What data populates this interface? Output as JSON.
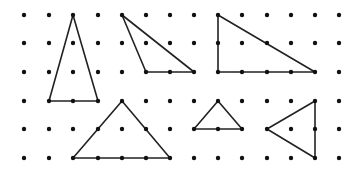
{
  "diagram": {
    "grid": {
      "columns_x": [
        24,
        49,
        73,
        98,
        122,
        146,
        170,
        194,
        218,
        242,
        267,
        291,
        315,
        339
      ],
      "rows_y": [
        15,
        43,
        72,
        101,
        129,
        158
      ],
      "dot_radius": 2.2,
      "dot_color": "#111111"
    },
    "line_color": "#222222",
    "line_width": 1.6,
    "triangles": [
      {
        "name": "tall-isosceles-triangle",
        "vertices": [
          [
            2,
            0
          ],
          [
            1,
            3
          ],
          [
            3,
            3
          ]
        ]
      },
      {
        "name": "obtuse-triangle",
        "vertices": [
          [
            4,
            0
          ],
          [
            5,
            2
          ],
          [
            7,
            2
          ]
        ]
      },
      {
        "name": "right-triangle",
        "vertices": [
          [
            8,
            0
          ],
          [
            8,
            2
          ],
          [
            12,
            2
          ]
        ]
      },
      {
        "name": "wide-isosceles-triangle",
        "vertices": [
          [
            4,
            3
          ],
          [
            2,
            5
          ],
          [
            6,
            5
          ]
        ]
      },
      {
        "name": "small-isosceles-triangle",
        "vertices": [
          [
            8,
            3
          ],
          [
            7,
            4
          ],
          [
            9,
            4
          ]
        ]
      },
      {
        "name": "left-pointing-triangle",
        "vertices": [
          [
            10,
            4
          ],
          [
            12,
            3
          ],
          [
            12,
            5
          ]
        ]
      }
    ]
  }
}
